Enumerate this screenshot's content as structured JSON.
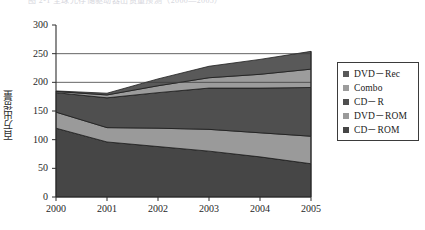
{
  "header": {
    "clipped_text": "图 2-1  全球光存储驱动器出货量预测（2000—2005）"
  },
  "axis": {
    "y_label": "百万出货量",
    "y_ticks": [
      "0",
      "50",
      "100",
      "150",
      "200",
      "250",
      "300"
    ],
    "x_ticks": [
      "2000",
      "2001",
      "2002",
      "2003",
      "2004",
      "2005"
    ]
  },
  "legend": {
    "items": [
      {
        "label": "DVD－Rec",
        "color": "#595959"
      },
      {
        "label": "Combo",
        "color": "#9c9c9c"
      },
      {
        "label": "CD－R",
        "color": "#4f4f4f"
      },
      {
        "label": "DVD－ROM",
        "color": "#9a9a9a"
      },
      {
        "label": "CD－ROM",
        "color": "#464646"
      }
    ]
  },
  "chart_data": {
    "type": "area",
    "stacked": true,
    "title": "",
    "xlabel": "",
    "ylabel": "百万出货量",
    "categories": [
      "2000",
      "2001",
      "2002",
      "2003",
      "2004",
      "2005"
    ],
    "ylim": [
      0,
      300
    ],
    "ytick_step": 50,
    "grid": "horizontal-partial",
    "series": [
      {
        "name": "CD－ROM",
        "color": "#464646",
        "values": [
          120,
          96,
          88,
          80,
          70,
          58
        ]
      },
      {
        "name": "DVD－ROM",
        "color": "#9a9a9a",
        "values": [
          28,
          25,
          32,
          38,
          42,
          48
        ]
      },
      {
        "name": "CD－R",
        "color": "#4f4f4f",
        "values": [
          34,
          52,
          62,
          72,
          78,
          85
        ]
      },
      {
        "name": "Combo",
        "color": "#9c9c9c",
        "values": [
          2,
          5,
          12,
          18,
          24,
          32
        ]
      },
      {
        "name": "DVD－Rec",
        "color": "#595959",
        "values": [
          1,
          3,
          12,
          20,
          26,
          31
        ]
      }
    ],
    "totals": [
      185,
      181,
      206,
      228,
      240,
      254
    ]
  },
  "colors": {
    "axis": "#2f2f2f",
    "gridline": "#3d3d3d",
    "background": "#ffffff",
    "band_edge": "#1c1c1c"
  }
}
